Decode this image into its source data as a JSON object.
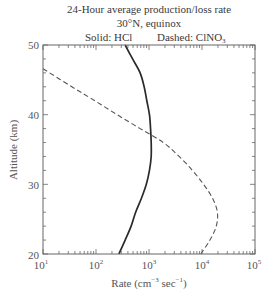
{
  "figure": {
    "title_line1": "24-Hour average production/loss rate",
    "title_line2": "30°N,  equinox",
    "legend_solid": "Solid: HCl",
    "legend_dashed_prefix": "Dashed: ClNO",
    "legend_dashed_sub": "3",
    "ylabel": "Altitude (km)",
    "xlabel_prefix": "Rate (cm",
    "xlabel_exp1": "−3",
    "xlabel_mid": " sec",
    "xlabel_exp2": "−1",
    "xlabel_suffix": ")"
  },
  "chart_data": {
    "type": "line",
    "title": "24-Hour average production/loss rate",
    "subtitle": "30°N, equinox",
    "xlabel": "Rate (cm^-3 sec^-1)",
    "ylabel": "Altitude (km)",
    "xscale": "log",
    "xlim": [
      10,
      100000
    ],
    "ylim": [
      20,
      50
    ],
    "xticks": [
      10,
      100,
      1000,
      10000,
      100000
    ],
    "xtick_labels": [
      {
        "base": "10",
        "exp": "1"
      },
      {
        "base": "10",
        "exp": "2"
      },
      {
        "base": "10",
        "exp": "3"
      },
      {
        "base": "10",
        "exp": "4"
      },
      {
        "base": "10",
        "exp": "5"
      }
    ],
    "yticks": [
      20,
      30,
      40,
      50
    ],
    "yminor_step": 2,
    "grid": false,
    "legend": [
      "Solid: HCl",
      "Dashed: ClNO3"
    ],
    "legend_position": "top (text above plot)",
    "series": [
      {
        "name": "HCl",
        "style": "solid",
        "color": "#2a2a2a",
        "altitude_km": [
          50,
          48,
          46,
          44,
          42,
          40,
          38,
          36,
          34,
          32,
          30,
          28,
          26,
          24,
          22,
          20
        ],
        "rate": [
          355,
          490,
          680,
          810,
          910,
          1020,
          1070,
          1100,
          1100,
          1020,
          890,
          720,
          560,
          460,
          355,
          270
        ]
      },
      {
        "name": "ClNO3",
        "style": "dashed",
        "color": "#555555",
        "altitude_km": [
          46.6,
          44,
          42,
          40,
          38,
          36,
          34,
          32,
          30,
          28,
          26,
          24,
          22,
          20
        ],
        "rate": [
          10,
          35,
          95,
          250,
          680,
          1860,
          3700,
          6600,
          10700,
          15800,
          19500,
          18600,
          14100,
          9500
        ]
      }
    ]
  }
}
